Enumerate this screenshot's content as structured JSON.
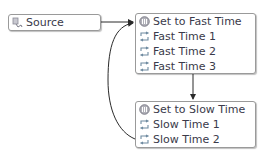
{
  "source": {
    "label": "Source",
    "icon": "source-icon"
  },
  "fast_group": {
    "items": [
      {
        "label": "Set to Fast Time",
        "icon": "set-time-icon"
      },
      {
        "label": "Fast Time 1",
        "icon": "loop-icon"
      },
      {
        "label": "Fast Time 2",
        "icon": "loop-icon"
      },
      {
        "label": "Fast Time 3",
        "icon": "loop-icon"
      }
    ]
  },
  "slow_group": {
    "items": [
      {
        "label": "Set to Slow Time",
        "icon": "set-time-icon"
      },
      {
        "label": "Slow Time 1",
        "icon": "loop-icon"
      },
      {
        "label": "Slow Time 2",
        "icon": "loop-icon"
      }
    ]
  },
  "colors": {
    "wire": "#2a2a2a",
    "border": "#9a9a9a",
    "text": "#3a3a4a"
  }
}
